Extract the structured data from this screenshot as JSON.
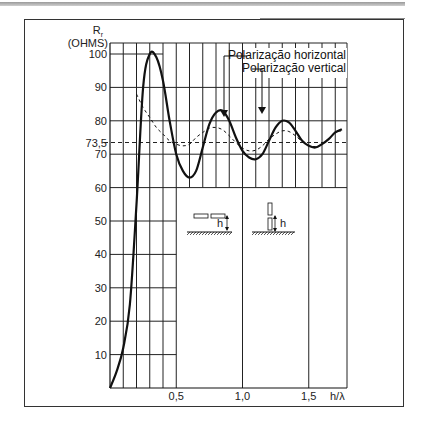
{
  "chart_data": {
    "type": "line",
    "title": "",
    "ylabel_line1": "Rᵣ",
    "ylabel_line2": "(OHMS)",
    "xlabel": "h/λ",
    "y_ticks": [
      "10",
      "20",
      "30",
      "40",
      "50",
      "60",
      "70",
      "73,5",
      "80",
      "90",
      "100"
    ],
    "y_tick_values": [
      10,
      20,
      30,
      40,
      50,
      60,
      70,
      73.5,
      80,
      90,
      100
    ],
    "x_ticks": [
      "0,5",
      "1,0",
      "1,5"
    ],
    "x_tick_values": [
      0.5,
      1.0,
      1.5
    ],
    "xlim": [
      0,
      1.75
    ],
    "ylim": [
      0,
      105
    ],
    "grid": true,
    "reference_line": {
      "value": 73.5,
      "style": "dashed"
    },
    "legend": [
      "Polarização horizontal",
      "Polarização vertical"
    ],
    "series": [
      {
        "name": "Polarização horizontal",
        "style": "solid",
        "x": [
          0.0,
          0.05,
          0.1,
          0.15,
          0.2,
          0.25,
          0.3,
          0.35,
          0.4,
          0.45,
          0.5,
          0.55,
          0.6,
          0.65,
          0.7,
          0.75,
          0.8,
          0.85,
          0.9,
          0.95,
          1.0,
          1.05,
          1.1,
          1.15,
          1.2,
          1.25,
          1.3,
          1.35,
          1.4,
          1.45,
          1.5,
          1.55,
          1.6,
          1.65,
          1.7,
          1.75
        ],
        "y": [
          0,
          5,
          12,
          25,
          55,
          90,
          100,
          99,
          92,
          80,
          70,
          65,
          63,
          65,
          72,
          79,
          82.5,
          83,
          80,
          75,
          71,
          69,
          68.5,
          70,
          74,
          78,
          80,
          79.5,
          77,
          74,
          72.5,
          72,
          73,
          74.5,
          76.5,
          77.5
        ]
      },
      {
        "name": "Polarização vertical",
        "style": "dashed",
        "x": [
          0.2,
          0.25,
          0.3,
          0.35,
          0.4,
          0.45,
          0.5,
          0.55,
          0.6,
          0.65,
          0.7,
          0.75,
          0.8,
          0.85,
          0.9,
          0.95,
          1.0,
          1.05,
          1.1,
          1.15,
          1.2,
          1.25,
          1.3,
          1.35,
          1.4,
          1.45,
          1.5,
          1.55,
          1.6,
          1.65,
          1.7,
          1.75
        ],
        "y": [
          88,
          84,
          81,
          78,
          76,
          74,
          73,
          72.5,
          73,
          75,
          76.5,
          77.8,
          78,
          77.3,
          75.5,
          73.5,
          71.8,
          71,
          71.2,
          72.5,
          74.5,
          76,
          77,
          76.8,
          75.5,
          73.8,
          72.6,
          72.3,
          73,
          74.5,
          76.5,
          77
        ]
      }
    ]
  },
  "labels": {
    "y_axis_symbol": "R",
    "y_axis_subscript": "r",
    "y_axis_unit": "(OHMS)",
    "x_axis_label": "h/λ",
    "legend_horizontal": "Polarização horizontal",
    "legend_vertical": "Polarização vertical",
    "inset_h_label": "h"
  }
}
